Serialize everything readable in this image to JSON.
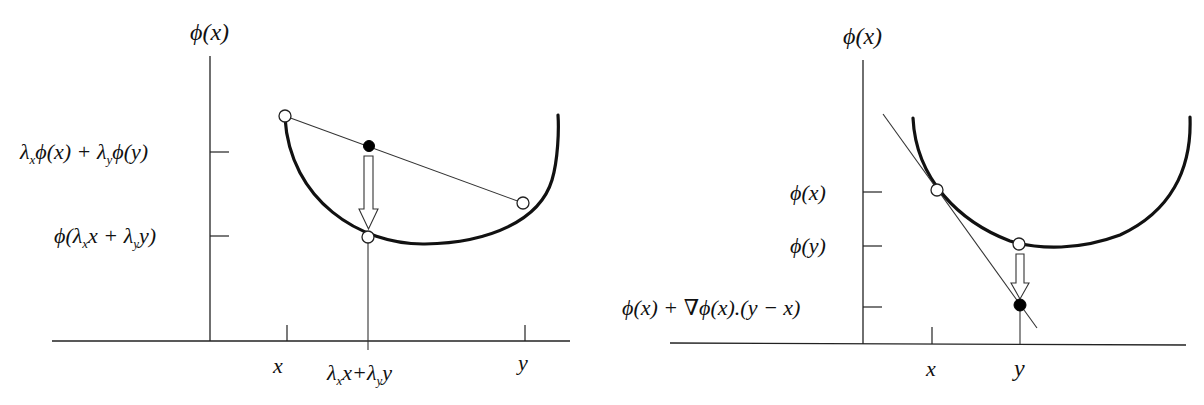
{
  "panels": [
    {
      "name": "convexity-chord",
      "y_axis_label": "ϕ(x)",
      "y_ticks": [
        {
          "label_parts": [
            "λ",
            "x",
            "ϕ(x) + λ",
            "y",
            "ϕ(y)"
          ],
          "label": "λ_x ϕ(x) + λ_y ϕ(y)"
        },
        {
          "label_parts": [
            "ϕ(λ",
            "x",
            "x + λ",
            "y",
            "y)"
          ],
          "label": "ϕ(λ_x x + λ_y y)"
        }
      ],
      "x_ticks": [
        {
          "label": "x"
        },
        {
          "label_parts": [
            "λ",
            "x",
            "x+λ",
            "y",
            "y"
          ],
          "label": "λ_x x+λ_y y"
        },
        {
          "label": "y"
        }
      ]
    },
    {
      "name": "first-order-condition",
      "y_axis_label": "ϕ(x)",
      "y_ticks": [
        {
          "label": "ϕ(x)"
        },
        {
          "label": "ϕ(y)"
        },
        {
          "label": "ϕ(x) + ∇ϕ(x).(y − x)"
        }
      ],
      "x_ticks": [
        {
          "label": "x"
        },
        {
          "label": "y"
        }
      ]
    }
  ]
}
